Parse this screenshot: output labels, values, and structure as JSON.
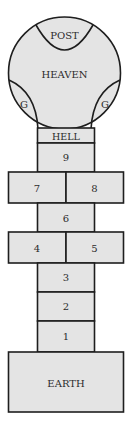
{
  "diagram": {
    "fill_color": "#e4e4e4",
    "stroke_color": "#1e1e1e",
    "text_color": "#2b2b2b",
    "top_circle": {
      "label": "HEAVEN",
      "post_label": "POST",
      "left_g_label": "G",
      "right_g_label": "G"
    },
    "hell_label": "HELL",
    "squares": {
      "s9": "9",
      "s8": "8",
      "s7": "7",
      "s6": "6",
      "s5": "5",
      "s4": "4",
      "s3": "3",
      "s2": "2",
      "s1": "1"
    },
    "base_label": "EARTH"
  }
}
